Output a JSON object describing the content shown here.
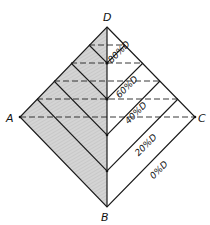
{
  "diagram": {
    "vertices": {
      "D": {
        "label": "D",
        "x": 107,
        "y": 27
      },
      "A": {
        "label": "A",
        "x": 20,
        "y": 117
      },
      "C": {
        "label": "C",
        "x": 195,
        "y": 117
      },
      "B": {
        "label": "B",
        "x": 107,
        "y": 207
      }
    },
    "shaded_region": {
      "vertices": [
        "A",
        "D",
        "B"
      ],
      "color": "#cfcfcf"
    },
    "dashed_levels_y": [
      45,
      63,
      81,
      99,
      117
    ],
    "chevron_lines": [
      {
        "label": "80%D",
        "center_y": 63
      },
      {
        "label": "60%D",
        "center_y": 99
      },
      {
        "label": "40%D",
        "center_y": 135
      },
      {
        "label": "20%D",
        "center_y": 171
      },
      {
        "label": "0%D",
        "center_y": 207
      }
    ]
  }
}
